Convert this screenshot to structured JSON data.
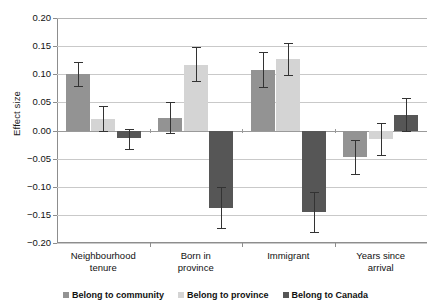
{
  "chart_data": {
    "type": "bar",
    "title": "",
    "xlabel": "",
    "ylabel": "Effect size",
    "ylim": [
      -0.2,
      0.2
    ],
    "ytick_labels": [
      "0.20",
      "0.15",
      "0.10",
      "0.05",
      "0.00",
      "-0.05",
      "-0.10",
      "-0.15",
      "-0.20"
    ],
    "ytick_values": [
      0.2,
      0.15,
      0.1,
      0.05,
      0.0,
      -0.05,
      -0.1,
      -0.15,
      -0.2
    ],
    "grid": true,
    "legend_position": "bottom",
    "categories": [
      "Neighbourhood tenure",
      "Born in province",
      "Immigrant",
      "Years since arrival"
    ],
    "category_lines": [
      [
        "Neighbourhood",
        "tenure"
      ],
      [
        "Born in",
        "province"
      ],
      [
        "Immigrant",
        ""
      ],
      [
        "Years since",
        "arrival"
      ]
    ],
    "series": [
      {
        "name": "Belong to community",
        "color": "#939393",
        "values": [
          0.1,
          0.023,
          0.108,
          -0.047
        ],
        "error_upper": [
          0.122,
          0.05,
          0.14,
          -0.017
        ],
        "error_lower": [
          0.079,
          -0.004,
          0.078,
          -0.077
        ]
      },
      {
        "name": "Belong to province",
        "color": "#d4d4d4",
        "values": [
          0.021,
          0.117,
          0.127,
          -0.015
        ],
        "error_upper": [
          0.044,
          0.148,
          0.155,
          0.014
        ],
        "error_lower": [
          -0.001,
          0.088,
          0.098,
          -0.044
        ]
      },
      {
        "name": "Belong to Canada",
        "color": "#565656",
        "values": [
          -0.013,
          -0.137,
          -0.145,
          0.028
        ],
        "error_upper": [
          0.002,
          -0.1,
          -0.11,
          0.057
        ],
        "error_lower": [
          -0.033,
          -0.173,
          -0.18,
          0.0
        ]
      }
    ]
  },
  "axis": {
    "y_title": "Effect size"
  },
  "colors": {
    "series1": "#939393",
    "series2": "#d4d4d4",
    "series3": "#565656",
    "grid": "#c9c9c9",
    "axis": "#8d8d8d",
    "error": "#333333"
  }
}
